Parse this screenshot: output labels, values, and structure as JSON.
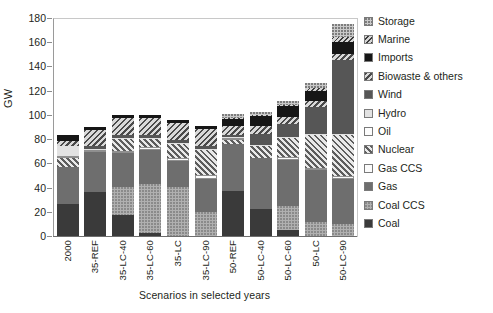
{
  "chart_data": {
    "type": "bar",
    "stacked": true,
    "title": "",
    "xlabel": "Scenarios in selected years",
    "ylabel": "GW",
    "ylim": [
      0,
      180
    ],
    "yticks": [
      0,
      20,
      40,
      60,
      80,
      100,
      120,
      140,
      160,
      180
    ],
    "grid": false,
    "legend_position": "right",
    "categories": [
      "2000",
      "35-REF",
      "35-LC-40",
      "35-LC-60",
      "35-LC",
      "35-LC-90",
      "50-REF",
      "50-LC-40",
      "50-LC-60",
      "50-LC",
      "50-LC-90"
    ],
    "series": [
      {
        "name": "Coal",
        "fill": "f-coal",
        "values": [
          27,
          37,
          18,
          3,
          0,
          0,
          38,
          23,
          6,
          0,
          0
        ]
      },
      {
        "name": "Coal CCS",
        "fill": "f-coalccs",
        "values": [
          0,
          0,
          23,
          41,
          41,
          21,
          0,
          0,
          20,
          12,
          11
        ]
      },
      {
        "name": "Gas",
        "fill": "f-gas",
        "values": [
          31,
          33,
          28,
          28,
          22,
          27,
          39,
          42,
          38,
          43,
          37
        ]
      },
      {
        "name": "Gas CCS",
        "fill": "f-gasccs",
        "values": [
          0,
          2,
          2,
          2,
          2,
          3,
          0,
          0,
          2,
          2,
          2
        ]
      },
      {
        "name": "Nuclear",
        "fill": "f-nuclear",
        "values": [
          7,
          0,
          10,
          7,
          12,
          21,
          3,
          10,
          16,
          27,
          34
        ]
      },
      {
        "name": "Oil",
        "fill": "f-oil",
        "values": [
          2,
          0,
          0,
          0,
          0,
          0,
          1,
          0,
          0,
          0,
          0
        ]
      },
      {
        "name": "Hydro",
        "fill": "f-hydro",
        "values": [
          8,
          1,
          1,
          1,
          1,
          1,
          1,
          1,
          1,
          1,
          1
        ]
      },
      {
        "name": "Wind",
        "fill": "f-wind",
        "values": [
          0,
          2,
          2,
          2,
          2,
          2,
          2,
          9,
          10,
          22,
          61
        ]
      },
      {
        "name": "Biowaste & others",
        "fill": "f-biowaste",
        "values": [
          4,
          13,
          14,
          14,
          14,
          14,
          7,
          7,
          6,
          5,
          5
        ]
      },
      {
        "name": "Imports",
        "fill": "f-imports",
        "values": [
          5,
          3,
          3,
          3,
          3,
          3,
          6,
          8,
          9,
          9,
          10
        ]
      },
      {
        "name": "Marine",
        "fill": "f-marine",
        "values": [
          0,
          0,
          0,
          0,
          0,
          0,
          1,
          1,
          1,
          2,
          4
        ]
      },
      {
        "name": "Storage",
        "fill": "f-storage",
        "values": [
          0,
          0,
          0,
          0,
          0,
          0,
          3,
          2,
          3,
          4,
          11
        ]
      }
    ],
    "totals": [
      84,
      91,
      101,
      101,
      97,
      92,
      101,
      103,
      112,
      127,
      176
    ]
  },
  "legend": {
    "items": [
      {
        "label": "Storage",
        "fill": "f-storage"
      },
      {
        "label": "Marine",
        "fill": "f-marine"
      },
      {
        "label": "Imports",
        "fill": "f-imports"
      },
      {
        "label": "Biowaste & others",
        "fill": "f-biowaste"
      },
      {
        "label": "Wind",
        "fill": "f-wind"
      },
      {
        "label": "Hydro",
        "fill": "f-hydro"
      },
      {
        "label": "Oil",
        "fill": "f-oil"
      },
      {
        "label": "Nuclear",
        "fill": "f-nuclear"
      },
      {
        "label": "Gas CCS",
        "fill": "f-gasccs"
      },
      {
        "label": "Gas",
        "fill": "f-gas"
      },
      {
        "label": "Coal CCS",
        "fill": "f-coalccs"
      },
      {
        "label": "Coal",
        "fill": "f-coal"
      }
    ]
  }
}
